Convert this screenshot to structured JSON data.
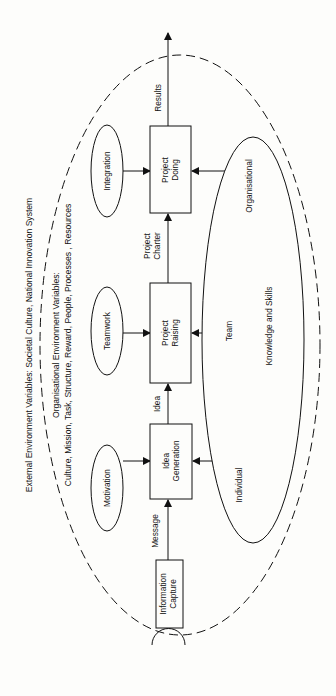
{
  "outer_environment": {
    "external_label": "External Environment Variables: Societal Culture, National Innovation System",
    "organisational_label_line1": "Organisational  Environment Variables:",
    "organisational_label_line2": "Culture, Mission, Task, Structure, Reward, People, Processes , Resources"
  },
  "process_boxes": [
    {
      "id": "information-capture",
      "line1": "Information",
      "line2": "Capture"
    },
    {
      "id": "idea-generation",
      "line1": "Idea",
      "line2": "Generation"
    },
    {
      "id": "project-raising",
      "line1": "Project",
      "line2": "Raising"
    },
    {
      "id": "project-doing",
      "line1": "Project",
      "line2": "Doing"
    }
  ],
  "flow_labels": {
    "message": "Message",
    "idea": "Idea",
    "project_charter_line1": "Project",
    "project_charter_line2": "Charter",
    "results": "Results"
  },
  "drivers": [
    {
      "id": "motivation",
      "label": "Motivation"
    },
    {
      "id": "teamwork",
      "label": "Teamwork"
    },
    {
      "id": "integration",
      "label": "Integration"
    }
  ],
  "knowledge": {
    "title": "Knowledge and Skills",
    "levels": [
      "Individual",
      "Team",
      "Organisational"
    ]
  },
  "colors": {
    "ink": "#111111",
    "paper": "#fdfdfb"
  }
}
